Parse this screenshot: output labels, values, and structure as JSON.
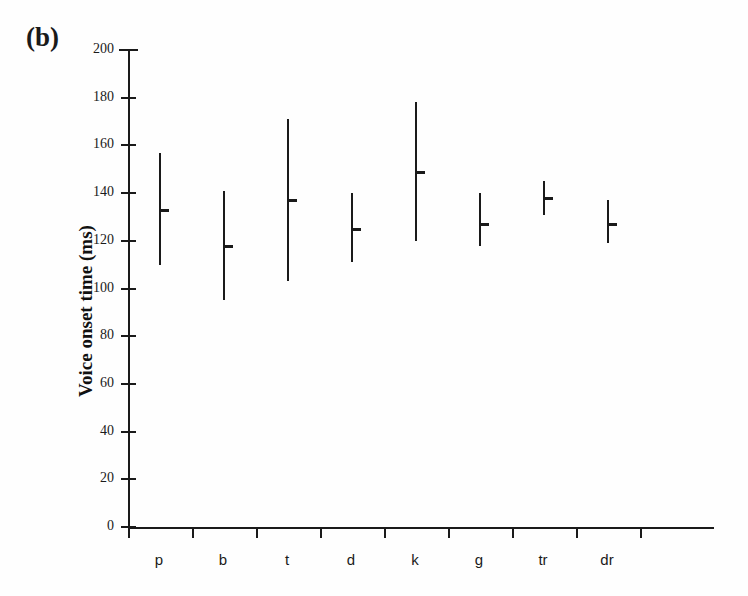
{
  "panel": {
    "label": "(b)"
  },
  "axes": {
    "y_title": "Voice onset time (ms)",
    "y_ticks": [
      0,
      20,
      40,
      60,
      80,
      100,
      120,
      140,
      160,
      180,
      200
    ],
    "x_labels": [
      "p",
      "b",
      "t",
      "d",
      "k",
      "g",
      "tr",
      "dr"
    ]
  },
  "chart_data": {
    "type": "scatter",
    "title": "(b)",
    "xlabel": "",
    "ylabel": "Voice onset time (ms)",
    "ylim": [
      0,
      200
    ],
    "ytick_step": 20,
    "grid": false,
    "legend": null,
    "categories": [
      "p",
      "b",
      "t",
      "d",
      "k",
      "g",
      "tr",
      "dr"
    ],
    "series": [
      {
        "name": "Voice onset time range with mean",
        "points": [
          {
            "category": "p",
            "mean": 133,
            "min": 110,
            "max": 157
          },
          {
            "category": "b",
            "mean": 118,
            "min": 95,
            "max": 141
          },
          {
            "category": "t",
            "mean": 137,
            "min": 103,
            "max": 171
          },
          {
            "category": "d",
            "mean": 125,
            "min": 111,
            "max": 140
          },
          {
            "category": "k",
            "mean": 149,
            "min": 120,
            "max": 178
          },
          {
            "category": "g",
            "mean": 127,
            "min": 118,
            "max": 140
          },
          {
            "category": "tr",
            "mean": 138,
            "min": 131,
            "max": 145
          },
          {
            "category": "dr",
            "mean": 127,
            "min": 119,
            "max": 137
          }
        ]
      }
    ],
    "marker": "horizontal-tick",
    "error_style": "vertical-range-line",
    "color": "#1a1a1a"
  },
  "geometry": {
    "y_zero_px": 527,
    "y_max_px": 50,
    "x_first_px": 159,
    "x_step_px": 64
  }
}
